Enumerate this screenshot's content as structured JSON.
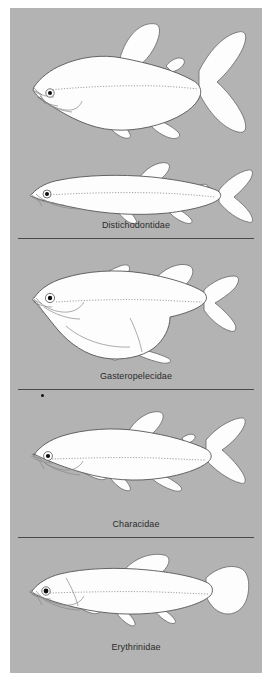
{
  "plate": {
    "background_color": "#b3b3b3",
    "page_color": "#ffffff",
    "line_color": "#4a4a4a",
    "fish_fill": "#fdfdfd",
    "fish_stroke": "#555555",
    "caption_color": "#2b2b2b"
  },
  "sections": [
    {
      "id": "distichodontidae",
      "label": "Distichodontidae",
      "fish_count": 2,
      "fish": [
        {
          "name": "deep-bodied-distichodontid",
          "body_shape": "deep-bodied, laterally compressed",
          "caudal": "deeply forked",
          "dorsal": "large rounded",
          "adipose": "small",
          "orientation": "head-left"
        },
        {
          "name": "elongate-distichodontid",
          "body_shape": "elongate pike-like",
          "caudal": "forked",
          "dorsal": "posterior rounded",
          "adipose": "small",
          "orientation": "head-left"
        }
      ]
    },
    {
      "id": "gasteropelecidae",
      "label": "Gasteropelecidae",
      "fish_count": 1,
      "fish": [
        {
          "name": "hatchetfish",
          "body_shape": "deep keeled hatchet-shaped belly",
          "caudal": "forked",
          "dorsal": "small posterior",
          "pectoral": "large wing-like",
          "orientation": "head-left"
        }
      ]
    },
    {
      "id": "characidae",
      "label": "Characidae",
      "fish_count": 1,
      "fish": [
        {
          "name": "characin",
          "body_shape": "moderately deep fusiform",
          "caudal": "forked",
          "dorsal": "triangular mid-body",
          "adipose": "small",
          "orientation": "head-left"
        }
      ]
    },
    {
      "id": "erythrinidae",
      "label": "Erythrinidae",
      "fish_count": 1,
      "fish": [
        {
          "name": "trahira",
          "body_shape": "cylindrical elongate",
          "caudal": "rounded",
          "dorsal": "long rounded mid-body",
          "orientation": "head-left"
        }
      ]
    }
  ],
  "marks": [
    {
      "name": "ink-speck",
      "shape": "dot"
    }
  ]
}
